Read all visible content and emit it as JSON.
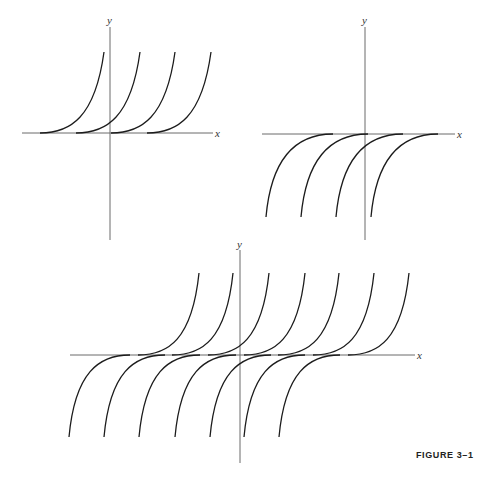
{
  "figure": {
    "caption": "FIGURE 3–1"
  },
  "colors": {
    "background": "#ffffff",
    "curve": "#1c1c1c",
    "axis": "#6b6b6b"
  },
  "panels": [
    {
      "id": "top-left",
      "x_label": "x",
      "y_label": "y",
      "description": "Family of translated curves rising upward from the x-axis (y >= 0 branches)",
      "curve_count": 4
    },
    {
      "id": "top-right",
      "x_label": "x",
      "y_label": "y",
      "description": "Family of translated curves descending below the x-axis (y <= 0 branches)",
      "curve_count": 4
    },
    {
      "id": "bottom",
      "x_label": "x",
      "y_label": "y",
      "description": "Combined family: translated S-shaped curves with upper and lower branches tangent to the x-axis",
      "upper_curve_count": 7,
      "lower_curve_count": 7
    }
  ]
}
